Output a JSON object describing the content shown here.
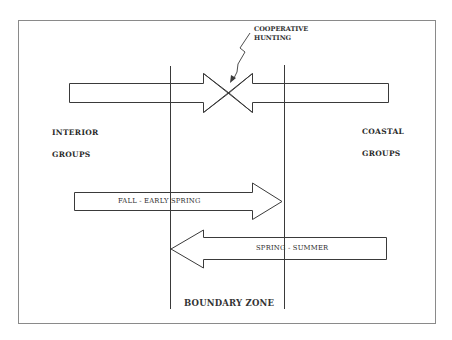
{
  "diagram": {
    "annotation": {
      "line1": "COOPERATIVE",
      "line2": "HUNTING"
    },
    "left_region": {
      "line1": "INTERIOR",
      "line2": "GROUPS"
    },
    "right_region": {
      "line1": "COASTAL",
      "line2": "GROUPS"
    },
    "arrows": [
      {
        "label": "FALL - EARLY SPRING",
        "direction": "right"
      },
      {
        "label": "SPRING - SUMMER",
        "direction": "left"
      }
    ],
    "zone_label": "BOUNDARY ZONE",
    "colors": {
      "stroke": "#3a3a3a",
      "frame": "#8a8a8a",
      "background": "#ffffff"
    }
  }
}
